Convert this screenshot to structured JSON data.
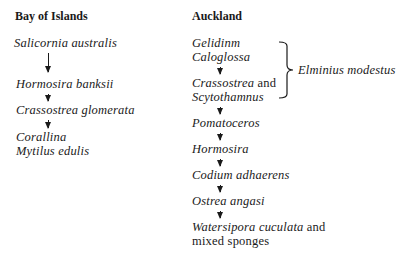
{
  "columns": [
    {
      "heading": "Bay of Islands",
      "items": [
        {
          "text": "Salicornia australis"
        },
        {
          "text": "Hormosira banksii"
        },
        {
          "text": "Crassostrea glomerata"
        },
        {
          "text": "Corallina"
        },
        {
          "text": "Mytilus edulis"
        }
      ]
    },
    {
      "heading": "Auckland",
      "items": [
        {
          "text": "Gelidinm"
        },
        {
          "text": "Caloglossa"
        },
        {
          "text": "Crassostrea",
          "suffix": " and"
        },
        {
          "text": "Scytothamnus"
        },
        {
          "text": "Pomatoceros"
        },
        {
          "text": "Hormosira"
        },
        {
          "text": "Codium adhaerens"
        },
        {
          "text": "Ostrea angasi"
        },
        {
          "text": "Watersipora cuculata",
          "suffix": " and"
        },
        {
          "text": "mixed sponges"
        }
      ],
      "brace_label": "Elminius modestus"
    }
  ]
}
